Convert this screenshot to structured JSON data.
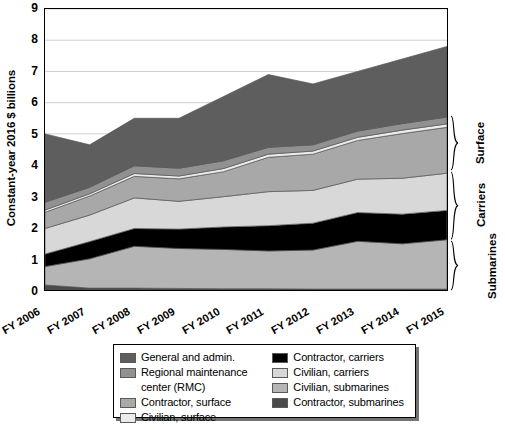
{
  "chart_data": {
    "type": "area",
    "title": "",
    "subtitle": "",
    "xlabel": "",
    "ylabel": "Constant-year 2016 $ billions",
    "categories": [
      "FY 2006",
      "FY 2007",
      "FY 2008",
      "FY 2009",
      "FY 2010",
      "FY 2011",
      "FY 2012",
      "FY 2013",
      "FY 2014",
      "FY 2015"
    ],
    "ylim": [
      0,
      9
    ],
    "yticks": [
      0,
      1,
      2,
      3,
      4,
      5,
      6,
      7,
      8,
      9
    ],
    "grid": true,
    "legend_position": "bottom",
    "stacked": true,
    "stack_order_bottom_to_top": [
      "Contractor, submarines",
      "Civilian, submarines",
      "Contractor, carriers",
      "Civilian, carriers",
      "Contractor, surface",
      "Civilian, surface",
      "Regional maintenance center (RMC)",
      "General and admin."
    ],
    "series": [
      {
        "name": "Contractor, submarines",
        "color": "#4a4a4a",
        "values": [
          0.16,
          0.06,
          0.06,
          0.05,
          0.04,
          0.04,
          0.03,
          0.03,
          0.03,
          0.03
        ]
      },
      {
        "name": "Civilian, submarines",
        "color": "#b5b5b5",
        "values": [
          0.59,
          0.94,
          1.34,
          1.28,
          1.26,
          1.21,
          1.25,
          1.53,
          1.45,
          1.58
        ]
      },
      {
        "name": "Contractor, carriers",
        "color": "#000000",
        "values": [
          0.4,
          0.55,
          0.57,
          0.62,
          0.72,
          0.81,
          0.86,
          0.92,
          0.95,
          0.94
        ]
      },
      {
        "name": "Civilian, carriers",
        "color": "#d8d8d8",
        "values": [
          0.82,
          0.85,
          0.98,
          0.89,
          0.97,
          1.09,
          1.05,
          1.07,
          1.15,
          1.19
        ]
      },
      {
        "name": "Contractor, surface",
        "color": "#a8a8a8",
        "values": [
          0.52,
          0.61,
          0.69,
          0.72,
          0.8,
          1.1,
          1.16,
          1.24,
          1.43,
          1.47
        ]
      },
      {
        "name": "Civilian, surface",
        "color": "#ececec",
        "values": [
          0.07,
          0.07,
          0.09,
          0.09,
          0.1,
          0.1,
          0.1,
          0.1,
          0.11,
          0.11
        ]
      },
      {
        "name": "Regional maintenance center (RMC)",
        "color": "#919191",
        "values": [
          0.25,
          0.21,
          0.25,
          0.25,
          0.25,
          0.22,
          0.2,
          0.2,
          0.21,
          0.22
        ]
      },
      {
        "name": "General and admin.",
        "color": "#5e5e5e",
        "values": [
          2.19,
          1.36,
          1.52,
          1.6,
          2.06,
          2.33,
          1.95,
          1.91,
          2.07,
          2.26
        ]
      }
    ],
    "totals": [
      5.0,
      4.65,
      5.5,
      5.5,
      6.2,
      6.9,
      6.6,
      7.0,
      7.4,
      7.8
    ]
  },
  "y_axis": {
    "title": "Constant-year 2016 $ billions",
    "ticks": [
      "0",
      "1",
      "2",
      "3",
      "4",
      "5",
      "6",
      "7",
      "8",
      "9"
    ]
  },
  "x_axis": {
    "ticks": [
      "FY 2006",
      "FY 2007",
      "FY 2008",
      "FY 2009",
      "FY 2010",
      "FY 2011",
      "FY 2012",
      "FY 2013",
      "FY 2014",
      "FY 2015"
    ]
  },
  "group_brackets": [
    {
      "label": "Surface",
      "top_value": 5.6,
      "bottom_value": 3.82
    },
    {
      "label": "Carriers",
      "top_value": 3.82,
      "bottom_value": 1.62
    },
    {
      "label": "Submarines",
      "top_value": 1.62,
      "bottom_value": 0.0
    }
  ],
  "legend": {
    "left_column": [
      {
        "label": "General and admin.",
        "color": "#5e5e5e",
        "swatch": true
      },
      {
        "label": "Regional maintenance",
        "color": "#919191",
        "swatch": true
      },
      {
        "label": "center (RMC)",
        "color": "",
        "swatch": false
      },
      {
        "label": "Contractor, surface",
        "color": "#a8a8a8",
        "swatch": true
      },
      {
        "label": "Civilian, surface",
        "color": "#ececec",
        "swatch": true
      }
    ],
    "right_column": [
      {
        "label": "Contractor, carriers",
        "color": "#000000",
        "swatch": true
      },
      {
        "label": "Civilian, carriers",
        "color": "#d8d8d8",
        "swatch": true
      },
      {
        "label": "Civilian, submarines",
        "color": "#b5b5b5",
        "swatch": true
      },
      {
        "label": "Contractor, submarines",
        "color": "#4a4a4a",
        "swatch": true
      }
    ]
  },
  "colors": {
    "plot_border": "#000000",
    "gridline": "#d0d0d0",
    "background": "#ffffff"
  }
}
